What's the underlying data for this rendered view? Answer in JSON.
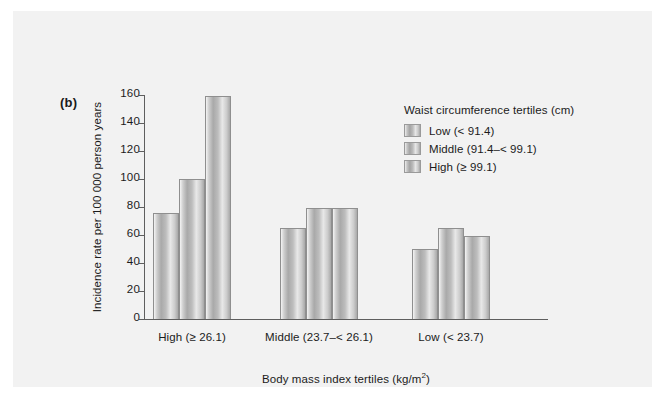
{
  "figure": {
    "panel_label": "(b)",
    "background_color": "#f2f2f2",
    "axis_color": "#5e5e5e",
    "bar_fill_color": "#bdbdbd"
  },
  "legend": {
    "title": "Waist circumference tertiles (cm)",
    "entries": [
      {
        "label": "Low (< 91.4)"
      },
      {
        "label": "Middle (91.4–< 99.1)"
      },
      {
        "label": "High (≥ 99.1)"
      }
    ]
  },
  "chart_data": {
    "type": "bar",
    "title": "",
    "subtitle": "",
    "xlabel": "Body mass index tertiles (kg/m2)",
    "xlabel_base": "Body mass index tertiles (kg/m",
    "xlabel_sup": "2",
    "xlabel_tail": ")",
    "ylabel": "Incidence rate per 100 000 person years",
    "ylim": [
      0,
      160
    ],
    "ytick_values": [
      0,
      20,
      40,
      60,
      80,
      100,
      120,
      140,
      160
    ],
    "ytick_labels": [
      "0",
      "20",
      "40",
      "60",
      "80",
      "100",
      "120",
      "140",
      "160"
    ],
    "grid": false,
    "legend_position": "upper right inside",
    "categories": [
      "High (≥ 26.1)",
      "Middle (23.7–< 26.1)",
      "Low (< 23.7)"
    ],
    "series": [
      {
        "name": "Low (< 91.4)",
        "values": [
          76,
          65,
          50
        ]
      },
      {
        "name": "Middle (91.4–< 99.1)",
        "values": [
          100,
          79,
          65
        ]
      },
      {
        "name": "High (≥ 99.1)",
        "values": [
          159,
          79,
          59
        ]
      }
    ]
  }
}
